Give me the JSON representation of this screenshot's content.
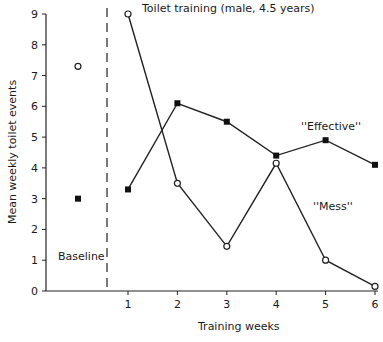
{
  "chart_data": {
    "type": "line",
    "title": "Toilet training (male, 4.5 years)",
    "xlabel": "Training weeks",
    "ylabel": "Mean weekly toilet events",
    "ylim": [
      0,
      9
    ],
    "yticks": [
      0,
      1,
      2,
      3,
      4,
      5,
      6,
      7,
      8,
      9
    ],
    "x": [
      1,
      2,
      3,
      4,
      5,
      6
    ],
    "xticks": [
      1,
      2,
      3,
      4,
      5,
      6
    ],
    "grid": false,
    "series": [
      {
        "name": "\"Mess\"",
        "marker": "open-circle",
        "values": [
          9.0,
          3.5,
          1.45,
          4.15,
          1.0,
          0.15
        ],
        "baseline": 7.3
      },
      {
        "name": "\"Effective\"",
        "marker": "filled-square",
        "values": [
          3.3,
          6.1,
          5.5,
          4.4,
          4.9,
          4.1
        ],
        "baseline": 3.0
      }
    ],
    "annotations": [
      {
        "text": "Baseline",
        "region": "baseline"
      },
      {
        "text": "\"Effective\"",
        "near_series": "Effective"
      },
      {
        "text": "\"Mess\"",
        "near_series": "Mess"
      }
    ],
    "baseline_divider": "dashed vertical line between baseline and week 1"
  },
  "labels": {
    "title": "Toilet training (male, 4.5 years)",
    "xlabel": "Training weeks",
    "ylabel": "Mean weekly toilet events",
    "baseline": "Baseline",
    "effective": "''Effective''",
    "mess": "''Mess''"
  }
}
